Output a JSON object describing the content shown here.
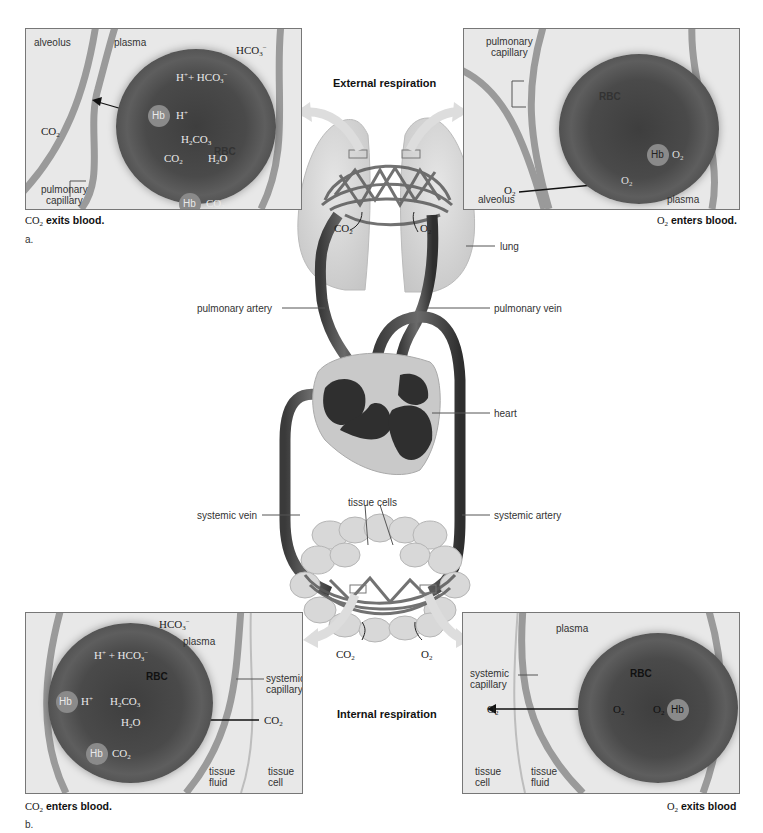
{
  "titles": {
    "external": "External respiration",
    "internal": "Internal respiration"
  },
  "panel_a_left": {
    "labels": {
      "alveolus": "alveolus",
      "plasma": "plasma",
      "rbc": "RBC",
      "pulmonary_capillary": [
        "pulmonary",
        "capillary"
      ]
    },
    "chem": {
      "hco3_out": "HCO3−",
      "h_plus_hco3": "H+ + HCO3−",
      "hb": "Hb",
      "h_plus": "H+",
      "h2co3": "H2CO3",
      "co2_inside": "CO2",
      "h2o": "H2O",
      "hb2": "Hb",
      "co2_hb": "CO2",
      "co2_out": "CO2"
    },
    "caption": "exits blood.",
    "caption_formula": "CO2",
    "part": "a."
  },
  "panel_a_right": {
    "labels": {
      "pulmonary_capillary": [
        "pulmonary",
        "capillary"
      ],
      "rbc": "RBC",
      "alveolus": "alveolus",
      "plasma": "plasma"
    },
    "chem": {
      "hb": "Hb",
      "o2_hb": "O2",
      "o2_inside": "O2",
      "o2_out": "O2"
    },
    "caption": "enters blood.",
    "caption_formula": "O2"
  },
  "panel_b_left": {
    "labels": {
      "plasma": "plasma",
      "rbc": "RBC",
      "systemic_capillary": [
        "systemic",
        "capillary"
      ],
      "tissue_fluid": [
        "tissue",
        "fluid"
      ],
      "tissue_cell": [
        "tissue",
        "cell"
      ]
    },
    "chem": {
      "hco3_out": "HCO3−",
      "h_plus_hco3": "H+ + HCO3−",
      "hb": "Hb",
      "h_plus": "H+",
      "h2co3": "H2CO3",
      "h2o": "H2O",
      "hb2": "Hb",
      "co2_hb": "CO2",
      "co2_in": "CO2"
    },
    "caption": "enters blood.",
    "caption_formula": "CO2",
    "part": "b."
  },
  "panel_b_right": {
    "labels": {
      "plasma": "plasma",
      "rbc": "RBC",
      "systemic_capillary": [
        "systemic",
        "capillary"
      ],
      "tissue_cell": [
        "tissue",
        "cell"
      ],
      "tissue_fluid": [
        "tissue",
        "fluid"
      ]
    },
    "chem": {
      "o2_out": "O2",
      "o2_inside": "O2",
      "o2_hb": "O2",
      "hb": "Hb"
    },
    "caption": "exits blood",
    "caption_formula": "O2"
  },
  "center": {
    "lung": "lung",
    "pulmonary_artery": "pulmonary artery",
    "pulmonary_vein": "pulmonary vein",
    "heart": "heart",
    "systemic_vein": "systemic vein",
    "systemic_artery": "systemic artery",
    "tissue_cells": "tissue cells",
    "co2_lung": "CO2",
    "o2_lung": "O2",
    "co2_tissue": "CO2",
    "o2_tissue": "O2"
  }
}
